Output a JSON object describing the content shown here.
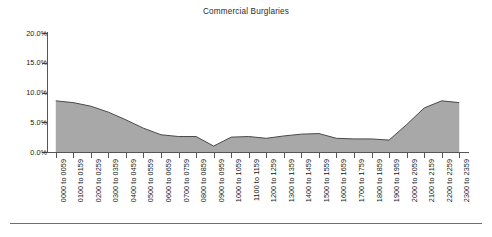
{
  "chart_data": {
    "type": "area",
    "title": "Commercial Burglaries",
    "xlabel": "",
    "ylabel": "",
    "ylim": [
      0,
      20
    ],
    "ytick_labels": [
      "20.0%",
      "15.0%",
      "10.0%",
      "5.0%",
      "0.0%"
    ],
    "ytick_values": [
      20,
      15,
      10,
      5,
      0
    ],
    "grid": false,
    "legend": "none",
    "categories": [
      "0000 to 0059",
      "0100 to 0159",
      "0200 to 0259",
      "0300 to 0359",
      "0400 to 0459",
      "0500 to 0559",
      "0600 to 0659",
      "0700 to 0759",
      "0800 to 0859",
      "0900 to 0959",
      "1000 to 1059",
      "1100 to 1159",
      "1200 to 1259",
      "1300 to 1359",
      "1400 to 1459",
      "1500 to 1559",
      "1600 to 1659",
      "1700 to 1759",
      "1800 to 1859",
      "1900 to 1959",
      "2000 to 2059",
      "2100 to 2159",
      "2200 to 2259",
      "2300 to 2359"
    ],
    "values": [
      8.6,
      8.3,
      7.7,
      6.7,
      5.4,
      4.0,
      2.9,
      2.6,
      2.6,
      1.0,
      2.5,
      2.6,
      2.3,
      2.7,
      3.0,
      3.1,
      2.3,
      2.2,
      2.2,
      2.0,
      4.6,
      7.4,
      8.6,
      8.3
    ],
    "value_unit": "percent",
    "series_fill_color": "#a8a8a8",
    "series_line_color": "#4a4a4a",
    "axis_color": "#555555",
    "background_color": "#ffffff"
  }
}
